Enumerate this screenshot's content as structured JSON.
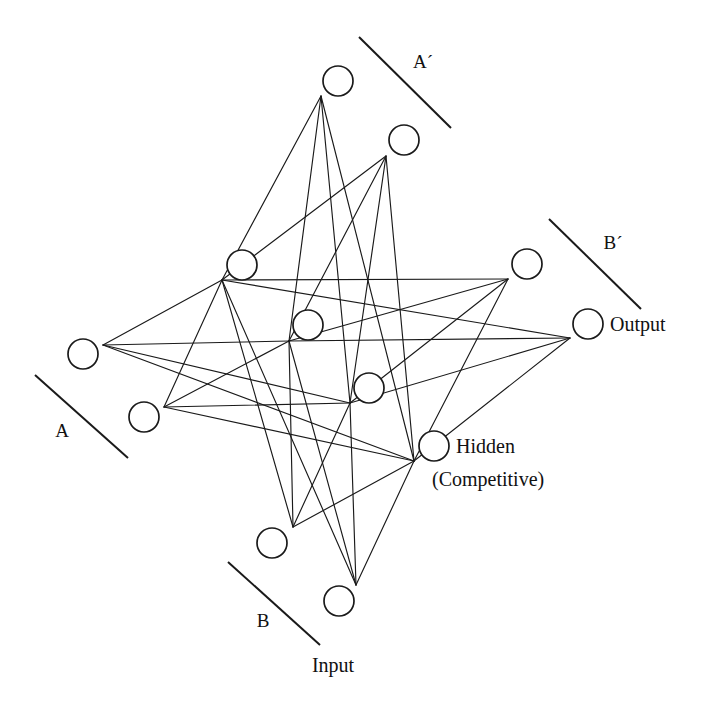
{
  "diagram": {
    "type": "node-link-diagram",
    "canvas": {
      "width": 710,
      "height": 708,
      "background": "#ffffff"
    },
    "style": {
      "node_radius": 15,
      "node_stroke": "#1a1a1a",
      "node_fill": "#ffffff",
      "edge_stroke": "#1a1a1a",
      "rule_stroke": "#1a1a1a"
    },
    "labels": {
      "group_a": "A",
      "group_b": "B",
      "group_a_prime": "A´",
      "group_b_prime": "B´",
      "input": "Input",
      "hidden_line1": "Hidden",
      "hidden_line2": "(Competitive)",
      "output": "Output"
    },
    "layers": [
      {
        "name": "input",
        "label": "Input",
        "groups": [
          {
            "name": "A",
            "nodes": [
              "input-a-1",
              "input-a-2"
            ]
          },
          {
            "name": "B",
            "nodes": [
              "input-b-1",
              "input-b-2"
            ]
          }
        ]
      },
      {
        "name": "hidden",
        "label": "Hidden (Competitive)",
        "nodes": [
          "hidden-1",
          "hidden-2",
          "hidden-3",
          "hidden-4"
        ]
      },
      {
        "name": "output",
        "label": "Output",
        "groups": [
          {
            "name": "A´",
            "nodes": [
              "output-a-1",
              "output-a-2"
            ]
          },
          {
            "name": "B´",
            "nodes": [
              "output-b-1",
              "output-b-2"
            ]
          }
        ]
      }
    ],
    "nodes": [
      {
        "id": "input-a-1",
        "cx": 83,
        "cy": 354,
        "hub_x": 103,
        "hub_y": 345,
        "group": "A",
        "layer": "input"
      },
      {
        "id": "input-a-2",
        "cx": 144,
        "cy": 417,
        "hub_x": 164,
        "hub_y": 407,
        "group": "A",
        "layer": "input"
      },
      {
        "id": "input-b-1",
        "cx": 272,
        "cy": 543,
        "hub_x": 293,
        "hub_y": 527,
        "group": "B",
        "layer": "input"
      },
      {
        "id": "input-b-2",
        "cx": 339,
        "cy": 601,
        "hub_x": 356,
        "hub_y": 585,
        "group": "B",
        "layer": "input"
      },
      {
        "id": "hidden-1",
        "cx": 242,
        "cy": 265,
        "hub_x": 222,
        "hub_y": 280,
        "group": "",
        "layer": "hidden"
      },
      {
        "id": "hidden-2",
        "cx": 308,
        "cy": 325,
        "hub_x": 289,
        "hub_y": 341,
        "group": "",
        "layer": "hidden"
      },
      {
        "id": "hidden-3",
        "cx": 369,
        "cy": 388,
        "hub_x": 350,
        "hub_y": 403,
        "group": "",
        "layer": "hidden"
      },
      {
        "id": "hidden-4",
        "cx": 434,
        "cy": 446,
        "hub_x": 414,
        "hub_y": 461,
        "group": "",
        "layer": "hidden"
      },
      {
        "id": "output-a-1",
        "cx": 338,
        "cy": 81,
        "hub_x": 321,
        "hub_y": 96,
        "group": "A´",
        "layer": "output"
      },
      {
        "id": "output-a-2",
        "cx": 404,
        "cy": 140,
        "hub_x": 386,
        "hub_y": 156,
        "group": "A´",
        "layer": "output"
      },
      {
        "id": "output-b-1",
        "cx": 527,
        "cy": 264,
        "hub_x": 508,
        "hub_y": 279,
        "group": "B´",
        "layer": "output"
      },
      {
        "id": "output-b-2",
        "cx": 588,
        "cy": 324,
        "hub_x": 570,
        "hub_y": 338,
        "group": "B´",
        "layer": "output"
      }
    ],
    "edges": [
      {
        "from": "input-a-1",
        "to": "hidden-1"
      },
      {
        "from": "input-a-1",
        "to": "hidden-2"
      },
      {
        "from": "input-a-1",
        "to": "hidden-3"
      },
      {
        "from": "input-a-1",
        "to": "hidden-4"
      },
      {
        "from": "input-a-2",
        "to": "hidden-1"
      },
      {
        "from": "input-a-2",
        "to": "hidden-2"
      },
      {
        "from": "input-a-2",
        "to": "hidden-3"
      },
      {
        "from": "input-a-2",
        "to": "hidden-4"
      },
      {
        "from": "input-b-1",
        "to": "hidden-1"
      },
      {
        "from": "input-b-1",
        "to": "hidden-2"
      },
      {
        "from": "input-b-1",
        "to": "hidden-3"
      },
      {
        "from": "input-b-1",
        "to": "hidden-4"
      },
      {
        "from": "input-b-2",
        "to": "hidden-1"
      },
      {
        "from": "input-b-2",
        "to": "hidden-2"
      },
      {
        "from": "input-b-2",
        "to": "hidden-3"
      },
      {
        "from": "input-b-2",
        "to": "hidden-4"
      },
      {
        "from": "hidden-1",
        "to": "output-a-1"
      },
      {
        "from": "hidden-1",
        "to": "output-a-2"
      },
      {
        "from": "hidden-1",
        "to": "output-b-1"
      },
      {
        "from": "hidden-1",
        "to": "output-b-2"
      },
      {
        "from": "hidden-2",
        "to": "output-a-1"
      },
      {
        "from": "hidden-2",
        "to": "output-a-2"
      },
      {
        "from": "hidden-2",
        "to": "output-b-1"
      },
      {
        "from": "hidden-2",
        "to": "output-b-2"
      },
      {
        "from": "hidden-3",
        "to": "output-a-1"
      },
      {
        "from": "hidden-3",
        "to": "output-a-2"
      },
      {
        "from": "hidden-3",
        "to": "output-b-1"
      },
      {
        "from": "hidden-3",
        "to": "output-b-2"
      },
      {
        "from": "hidden-4",
        "to": "output-a-1"
      },
      {
        "from": "hidden-4",
        "to": "output-a-2"
      },
      {
        "from": "hidden-4",
        "to": "output-b-1"
      },
      {
        "from": "hidden-4",
        "to": "output-b-2"
      }
    ],
    "group_rules": [
      {
        "id": "rule-a",
        "x1": 35,
        "y1": 375,
        "x2": 128,
        "y2": 458
      },
      {
        "id": "rule-b",
        "x1": 228,
        "y1": 562,
        "x2": 320,
        "y2": 645
      },
      {
        "id": "rule-a-prime",
        "x1": 359,
        "y1": 37,
        "x2": 451,
        "y2": 128
      },
      {
        "id": "rule-b-prime",
        "x1": 549,
        "y1": 219,
        "x2": 641,
        "y2": 309
      }
    ],
    "text_labels": [
      {
        "id": "label-a",
        "text": "A",
        "x": 62,
        "y": 437,
        "anchor": "middle",
        "class": "group-label"
      },
      {
        "id": "label-b",
        "text": "B",
        "x": 263,
        "y": 627,
        "anchor": "middle",
        "class": "group-label"
      },
      {
        "id": "label-a-prime",
        "text": "A´",
        "x": 423,
        "y": 68,
        "anchor": "middle",
        "class": "group-label"
      },
      {
        "id": "label-b-prime",
        "text": "B´",
        "x": 613,
        "y": 249,
        "anchor": "middle",
        "class": "group-label"
      },
      {
        "id": "label-input",
        "text": "Input",
        "x": 333,
        "y": 672,
        "anchor": "middle",
        "class": "layer-label"
      },
      {
        "id": "label-hidden",
        "text": "Hidden",
        "x": 456,
        "y": 453,
        "anchor": "start",
        "class": "layer-label"
      },
      {
        "id": "label-hidden2",
        "text": "(Competitive)",
        "x": 432,
        "y": 486,
        "anchor": "start",
        "class": "layer-label"
      },
      {
        "id": "label-output",
        "text": "Output",
        "x": 610,
        "y": 331,
        "anchor": "start",
        "class": "layer-label"
      }
    ]
  }
}
